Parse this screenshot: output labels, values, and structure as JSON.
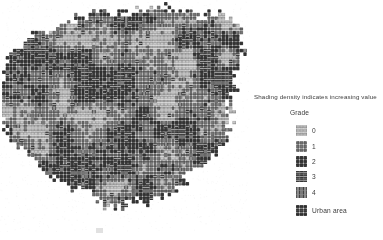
{
  "figure": {
    "type": "grid-choropleth-map"
  },
  "legend": {
    "caption": "Shading density indicates increasing value",
    "title": "Grade",
    "items": [
      {
        "label": "0",
        "pattern": "horizontal-lines-sparse",
        "density": 0.12,
        "swatch_name": "legend-swatch-grade-0"
      },
      {
        "label": "1",
        "pattern": "grid-light",
        "density": 0.28,
        "swatch_name": "legend-swatch-grade-1"
      },
      {
        "label": "2",
        "pattern": "grid-medium",
        "density": 0.45,
        "swatch_name": "legend-swatch-grade-2"
      },
      {
        "label": "3",
        "pattern": "vertical-bars-dense",
        "density": 0.68,
        "swatch_name": "legend-swatch-grade-3"
      },
      {
        "label": "4",
        "pattern": "vertical-bars-solid",
        "density": 0.88,
        "swatch_name": "legend-swatch-grade-4"
      }
    ],
    "urban": {
      "label": "Urban area",
      "pattern": "fine-grid",
      "density": 0.3,
      "swatch_name": "legend-swatch-urban-area"
    }
  },
  "colors": {
    "ink": "#1a1a1a",
    "text": "#3a3a3a",
    "paper": "#ffffff",
    "mid_gray": "#8a8a8a",
    "light_gray": "#c9c9c9"
  },
  "chart_data": {
    "type": "heatmap",
    "title": "",
    "xlabel": "",
    "ylabel": "",
    "grid": true,
    "legend_position": "right",
    "cell_size_px": 3.6,
    "columns": 68,
    "rows": 62,
    "value_scale": [
      0,
      1,
      2,
      3,
      4
    ],
    "categories": [
      "0",
      "1",
      "2",
      "3",
      "4"
    ],
    "values": [
      0,
      1,
      2,
      3,
      4
    ]
  }
}
